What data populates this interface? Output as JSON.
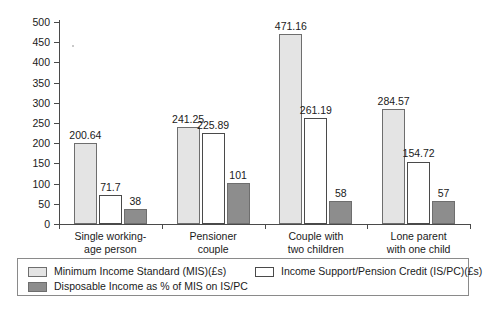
{
  "chart_data": {
    "type": "bar",
    "title": "",
    "xlabel": "",
    "ylabel": "",
    "ylim": [
      0,
      500
    ],
    "ytick_step": 50,
    "yticks": [
      0,
      50,
      100,
      150,
      200,
      250,
      300,
      350,
      400,
      450,
      500
    ],
    "grid": false,
    "legend_position": "bottom",
    "categories": [
      "Single working-\nage person",
      "Pensioner\ncouple",
      "Couple with\ntwo children",
      "Lone parent\nwith one child"
    ],
    "series": [
      {
        "name": "Minimum Income Standard (MIS)(£s)",
        "key": "mis",
        "color": "#e4e4e4",
        "values": [
          200.64,
          241.25,
          471.16,
          284.57
        ],
        "labels": [
          "200.64",
          "241.25",
          "471.16",
          "284.57"
        ]
      },
      {
        "name": "Income Support/Pension Credit (IS/PC)(£s)",
        "key": "ispc",
        "color": "#ffffff",
        "values": [
          71.7,
          225.89,
          261.19,
          154.72
        ],
        "labels": [
          "71.7",
          "225.89",
          "261.19",
          "154.72"
        ]
      },
      {
        "name": "Disposable Income as % of MIS on IS/PC",
        "key": "disp",
        "color": "#8d8d8d",
        "values": [
          38,
          101,
          58,
          57
        ],
        "labels": [
          "38",
          "101",
          "58",
          "57"
        ]
      }
    ]
  },
  "axis": {
    "y_tick_labels": [
      "500",
      "450",
      "400",
      "350",
      "300",
      "250",
      "200",
      "150",
      "100",
      "50",
      "0"
    ]
  },
  "legend": {
    "items": [
      {
        "label": "Minimum Income Standard (MIS)(£s)",
        "key": "mis"
      },
      {
        "label": "Income Support/Pension Credit (IS/PC)(£s)",
        "key": "ispc"
      },
      {
        "label": "Disposable Income as % of MIS on IS/PC",
        "key": "disp"
      }
    ]
  }
}
